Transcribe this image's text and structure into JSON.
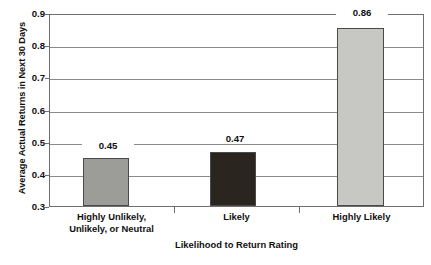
{
  "chart_data": {
    "type": "bar",
    "title": "",
    "subtitle": "",
    "xlabel": "Likelihood to Return Rating",
    "ylabel": "Average Actual Returns in Next 30 Days",
    "categories": [
      "Highly Unlikely,\nUnlikely, or Neutral",
      "Likely",
      "Highly Likely"
    ],
    "values": [
      0.45,
      0.47,
      0.86
    ],
    "value_labels": [
      "0.45",
      "0.47",
      "0.86"
    ],
    "ylim": [
      0.3,
      0.9
    ],
    "ytick_labels": [
      "0.3",
      "0.4",
      "0.5",
      "0.6",
      "0.7",
      "0.8",
      "0.9"
    ],
    "ytick_values": [
      0.3,
      0.4,
      0.5,
      0.6,
      0.7,
      0.8,
      0.9
    ],
    "grid": true,
    "grid_axis": "y",
    "legend": false,
    "legend_position": "none",
    "bar_colors": [
      "#9c9c98",
      "#2b2520",
      "#c7c7c4"
    ],
    "bar_edge_color": "#4a4a4a",
    "axis_color": "#6e6e6e",
    "gridline_color": "#8a8a8a",
    "background_color": "#ffffff",
    "text_color": "#111111"
  }
}
